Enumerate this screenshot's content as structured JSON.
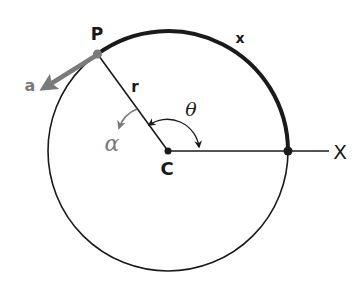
{
  "diagram": {
    "type": "circular-motion",
    "labels": {
      "point_p": "P",
      "center": "C",
      "axis": "X",
      "radius": "r",
      "arc_length": "x",
      "angle": "θ",
      "angular_acceleration": "α",
      "acceleration": "a"
    },
    "colors": {
      "ink": "#1a1a1a",
      "accent_gray": "#7a7a7a"
    }
  }
}
